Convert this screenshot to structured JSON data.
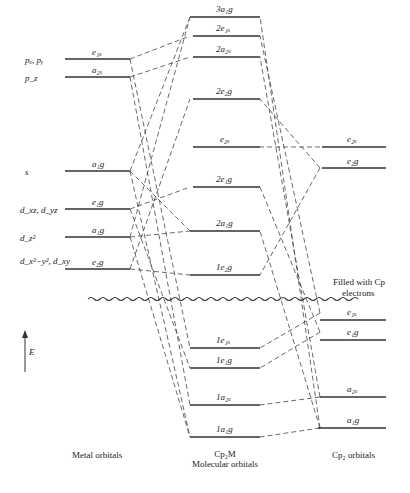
{
  "diagram": {
    "columns": {
      "metal": {
        "caption": "Metal orbitals"
      },
      "mo": {
        "caption_line1": "Cp₂M",
        "caption_line2": "Molecular orbitals"
      },
      "ligand": {
        "caption": "Cp₂ orbitals"
      }
    },
    "energy_axis_label": "E",
    "filled_note_line1": "Filled with Cp",
    "filled_note_line2": "electrons",
    "metal_levels": [
      {
        "id": "m_e1u",
        "side_label": "pₓ, pᵧ",
        "sym": "e₁ᵤ",
        "y": 59
      },
      {
        "id": "m_a2u",
        "side_label": "p_z",
        "sym": "a₂ᵤ",
        "y": 77
      },
      {
        "id": "m_a1g_s",
        "side_label": "s",
        "sym": "a₁g",
        "y": 171
      },
      {
        "id": "m_e1g",
        "side_label": "d_xz, d_yz",
        "sym": "e₁g",
        "y": 209
      },
      {
        "id": "m_a1g_d",
        "side_label": "d_z²",
        "sym": "a₁g",
        "y": 237
      },
      {
        "id": "m_e2g",
        "side_label": "d_x²−y², d_xy",
        "sym": "e₂g",
        "y": 269
      }
    ],
    "mo_levels": [
      {
        "id": "mo_3a1g",
        "sym": "3a₁g",
        "y": 17
      },
      {
        "id": "mo_2e1u",
        "sym": "2e₁ᵤ",
        "y": 36
      },
      {
        "id": "mo_2a2u",
        "sym": "2a₂ᵤ",
        "y": 57
      },
      {
        "id": "mo_2e2g",
        "sym": "2e₂g",
        "y": 99
      },
      {
        "id": "mo_e2u",
        "sym": "e₂ᵤ",
        "y": 147
      },
      {
        "id": "mo_2e1g",
        "sym": "2e₁g",
        "y": 187
      },
      {
        "id": "mo_2a1g",
        "sym": "2a₁g",
        "y": 231
      },
      {
        "id": "mo_1e2g",
        "sym": "1e₂g",
        "y": 275
      },
      {
        "id": "mo_1e1u",
        "sym": "1e₁ᵤ",
        "y": 348
      },
      {
        "id": "mo_1e1g",
        "sym": "1e₁g",
        "y": 368
      },
      {
        "id": "mo_1a2u",
        "sym": "1a₂ᵤ",
        "y": 405
      },
      {
        "id": "mo_1a1g",
        "sym": "1a₁g",
        "y": 437
      }
    ],
    "ligand_levels": [
      {
        "id": "l_e2u",
        "sym": "e₂ᵤ",
        "y": 147
      },
      {
        "id": "l_e2g",
        "sym": "e₂g",
        "y": 168
      },
      {
        "id": "l_e1u",
        "sym": "e₁ᵤ",
        "y": 313
      },
      {
        "id": "l_e1g",
        "sym": "e₁g",
        "y": 332
      },
      {
        "id": "l_a2u",
        "sym": "a₂ᵤ",
        "y": 397
      },
      {
        "id": "l_a1g",
        "sym": "a₁g",
        "y": 428
      }
    ]
  }
}
